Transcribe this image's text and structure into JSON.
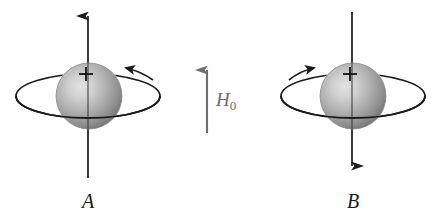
{
  "figure": {
    "background_color": "#ffffff",
    "width": 436,
    "height": 220,
    "ink_color": "#1a1a1a",
    "field_color": "#6e6e6e",
    "sphere_light_color": "#d8d8d8",
    "sphere_mid_color": "#a8a8a8",
    "sphere_dark_color": "#6f6f6f"
  },
  "items": [
    {
      "id": "A",
      "label": "A",
      "label_x": 88,
      "label_y": 208,
      "sphere_cx": 89,
      "sphere_cy": 96,
      "sphere_r": 33,
      "axis_x": 88,
      "axis_top_y": 10,
      "axis_bottom_y": 178,
      "axis_arrow_direction": "up",
      "charge_marker": "+",
      "charge_marker_x": 86,
      "charge_marker_y": 74,
      "ring_rx": 72,
      "ring_ry": 22,
      "ring_arrow_direction": "left",
      "ring_arrow_label": "counterclockwise"
    },
    {
      "id": "B",
      "label": "B",
      "label_x": 353,
      "label_y": 208,
      "sphere_cx": 353,
      "sphere_cy": 96,
      "sphere_r": 33,
      "axis_x": 352,
      "axis_top_y": 12,
      "axis_bottom_y": 172,
      "axis_arrow_direction": "down",
      "charge_marker": "+",
      "charge_marker_x": 350,
      "charge_marker_y": 74,
      "ring_rx": 72,
      "ring_ry": 22,
      "ring_arrow_direction": "right",
      "ring_arrow_label": "clockwise"
    }
  ],
  "field": {
    "symbol": "H",
    "subscript": "0",
    "full_label": "H0",
    "arrow_x": 207,
    "arrow_top_y": 64,
    "arrow_bottom_y": 133,
    "arrow_direction": "up",
    "label_x": 216,
    "label_y": 106
  }
}
